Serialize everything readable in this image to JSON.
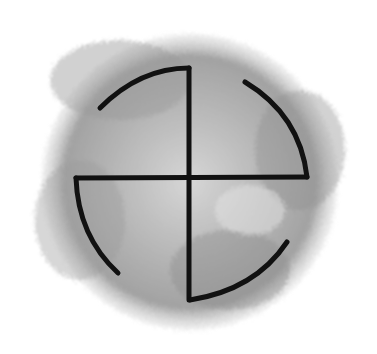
{
  "image": {
    "subject": "hand-drawn sun cross / swastika-like symbol over gray watercolor circle",
    "background_color": "#ffffff",
    "wash_color": "#9a9a9a",
    "stroke_color": "#111111"
  }
}
